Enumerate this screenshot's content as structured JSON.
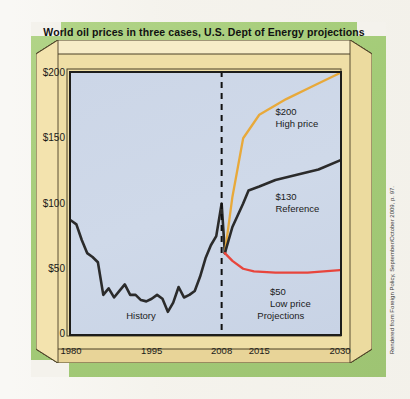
{
  "title": "World oil prices in three cases, U.S. Dept of Energy projections",
  "credit": "Rendered from Foreign Policy, September/October 2009, p. 97.",
  "colors": {
    "green_panel": "#a8cf7e",
    "box_face": "#f0dfa4",
    "box_top": "#f6ecc4",
    "plot_bg": "#ccd7e8",
    "high_price": "#e8a93a",
    "reference": "#2b2b2b",
    "low_price": "#e8453c",
    "divider": "#111111"
  },
  "ghost_text": [
    "the accepted wisdom that",
    "a shortfall in supply",
    "drove the run-up in",
    "prices, the new",
    "evidence suggests",
    "otherwise. As global",
    "demand fell, so",
    "oil prices soared.",
    "Washington must",
    "look again at how",
    "to secure energy",
    "markets now and",
    "for the decades",
    "ahead"
  ],
  "chart_data": {
    "type": "line",
    "title": "World oil prices in three cases, U.S. Dept of Energy projections",
    "xlabel": "",
    "ylabel": "",
    "xlim": [
      1980,
      2030
    ],
    "ylim": [
      0,
      200
    ],
    "yticks": [
      "0",
      "$50",
      "$100",
      "$150",
      "$200"
    ],
    "ytick_values": [
      0,
      50,
      100,
      150,
      200
    ],
    "xticks": [
      "1980",
      "1995",
      "2008",
      "2015",
      "2030"
    ],
    "xtick_values": [
      1980,
      1995,
      2008,
      2015,
      2030
    ],
    "grid": false,
    "legend": "annotations",
    "divider_year": 2008,
    "region_labels": [
      {
        "label": "History",
        "x": 1993
      },
      {
        "label": "Projections",
        "x": 2019
      }
    ],
    "annotations": [
      {
        "value": "$200",
        "name": "High price",
        "x": 2018,
        "y": 170
      },
      {
        "value": "$130",
        "name": "Reference",
        "x": 2018,
        "y": 105
      },
      {
        "value": "$50",
        "name": "Low price",
        "x": 2017,
        "y": 32
      }
    ],
    "series": [
      {
        "name": "History",
        "color": "#2b2b2b",
        "points": [
          [
            1980,
            87
          ],
          [
            1981,
            84
          ],
          [
            1982,
            72
          ],
          [
            1983,
            62
          ],
          [
            1984,
            59
          ],
          [
            1985,
            55
          ],
          [
            1986,
            30
          ],
          [
            1987,
            35
          ],
          [
            1988,
            28
          ],
          [
            1989,
            33
          ],
          [
            1990,
            38
          ],
          [
            1991,
            30
          ],
          [
            1992,
            30
          ],
          [
            1993,
            26
          ],
          [
            1994,
            25
          ],
          [
            1995,
            27
          ],
          [
            1996,
            30
          ],
          [
            1997,
            27
          ],
          [
            1998,
            17
          ],
          [
            1999,
            24
          ],
          [
            2000,
            36
          ],
          [
            2001,
            28
          ],
          [
            2002,
            30
          ],
          [
            2003,
            33
          ],
          [
            2004,
            44
          ],
          [
            2005,
            58
          ],
          [
            2006,
            68
          ],
          [
            2007,
            75
          ],
          [
            2008,
            100
          ],
          [
            2008.6,
            62
          ]
        ]
      },
      {
        "name": "High price",
        "color": "#e8a93a",
        "points": [
          [
            2008.6,
            62
          ],
          [
            2010,
            105
          ],
          [
            2012,
            150
          ],
          [
            2015,
            168
          ],
          [
            2020,
            180
          ],
          [
            2025,
            190
          ],
          [
            2030,
            200
          ]
        ]
      },
      {
        "name": "Reference",
        "color": "#2b2b2b",
        "points": [
          [
            2008.6,
            62
          ],
          [
            2010,
            82
          ],
          [
            2012,
            100
          ],
          [
            2013,
            110
          ],
          [
            2015,
            113
          ],
          [
            2018,
            118
          ],
          [
            2022,
            122
          ],
          [
            2026,
            126
          ],
          [
            2030,
            133
          ]
        ]
      },
      {
        "name": "Low price",
        "color": "#e8453c",
        "points": [
          [
            2008.6,
            62
          ],
          [
            2010,
            56
          ],
          [
            2012,
            50
          ],
          [
            2014,
            48
          ],
          [
            2018,
            47
          ],
          [
            2024,
            47
          ],
          [
            2030,
            49
          ]
        ]
      }
    ]
  }
}
